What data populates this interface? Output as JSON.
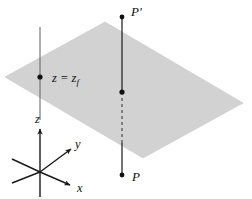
{
  "figure": {
    "background_color": "#ffffff",
    "plane": {
      "name": "shaded-plane",
      "fill_color": "#d2d2d2",
      "edge_color": "#c4c4c4",
      "vertices": [
        [
          5,
          77
        ],
        [
          105,
          22
        ],
        [
          243,
          103
        ],
        [
          143,
          158
        ]
      ]
    },
    "labels": {
      "plane_level": "z = z",
      "plane_level_sub": "f",
      "point_upper": "P'",
      "point_lower": "P",
      "axis_z": "z",
      "axis_y": "y",
      "axis_x": "x"
    },
    "lines": {
      "left_vertical": {
        "name": "left-vertical-line",
        "x": 40,
        "y_top": 27,
        "y_bottom": 120,
        "color": "#6a6a6a",
        "width": 1.1
      },
      "right_vertical_upper": {
        "name": "right-vertical-line-upper",
        "x": 122,
        "y_top": 17,
        "y_bottom": 92,
        "color": "#2a2a2a",
        "width": 1.3
      },
      "right_vertical_dashed": {
        "name": "right-vertical-line-dashed",
        "x": 122,
        "y_top": 92,
        "y_bottom": 143,
        "color": "#4a4a4a",
        "width": 1.2,
        "dash": "3,3"
      },
      "right_vertical_lower": {
        "name": "right-vertical-line-lower",
        "x": 122,
        "y_top": 143,
        "y_bottom": 175,
        "color": "#2a2a2a",
        "width": 1.3
      }
    },
    "markers": {
      "plane_intersection_left": {
        "name": "dot-z-equals-zf",
        "x": 40,
        "y": 77,
        "r": 2.6
      },
      "point_upper": {
        "name": "dot-p-prime",
        "x": 122,
        "y": 17,
        "r": 2.4
      },
      "point_plane_cross": {
        "name": "dot-plane-crossing",
        "x": 122,
        "y": 92,
        "r": 2.6
      },
      "point_lower": {
        "name": "dot-p",
        "x": 122,
        "y": 175,
        "r": 2.4
      }
    },
    "axes": {
      "origin": [
        40,
        172
      ],
      "z_positive_tip": [
        40,
        127
      ],
      "z_negative_tip": [
        40,
        197
      ],
      "y_positive_tip": [
        73,
        147
      ],
      "y_negative_tip": [
        12,
        160
      ],
      "x_positive_tip": [
        72,
        186
      ],
      "x_negative_tip": [
        12,
        159
      ],
      "color": "#1a1a1a",
      "width": 1.4
    },
    "label_positions": {
      "plane_level": [
        52,
        82
      ],
      "point_upper": [
        131,
        15
      ],
      "point_lower": [
        132,
        181
      ],
      "axis_z": [
        36,
        122
      ],
      "axis_y": [
        76,
        145
      ],
      "axis_x": [
        78,
        191
      ]
    }
  }
}
